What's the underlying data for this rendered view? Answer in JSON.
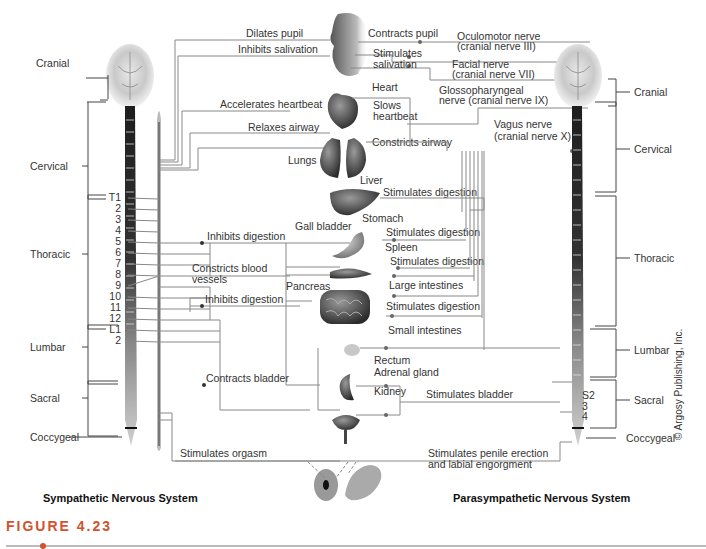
{
  "figure": {
    "label": "FIGURE 4.23",
    "accent_color": "#d0532e",
    "copyright": "© Argosy Publishing, Inc."
  },
  "titles": {
    "sympathetic": "Sympathetic Nervous System",
    "parasympathetic": "Parasympathetic Nervous System"
  },
  "left_regions": {
    "cranial": "Cranial",
    "cervical": "Cervical",
    "thoracic": "Thoracic",
    "lumbar": "Lumbar",
    "sacral": "Sacral",
    "coccygeal": "Coccygeal"
  },
  "right_regions": {
    "cranial": "Cranial",
    "cervical": "Cervical",
    "thoracic": "Thoracic",
    "lumbar": "Lumbar",
    "sacral": "Sacral",
    "coccygeal": "Coccygeal"
  },
  "vertebrae_left": [
    "T1",
    "2",
    "3",
    "4",
    "5",
    "6",
    "7",
    "8",
    "9",
    "10",
    "11",
    "12",
    "L1",
    "2"
  ],
  "vertebrae_right": [
    "S2",
    "3",
    "4"
  ],
  "sympathetic_effects": {
    "dilates_pupil": "Dilates pupil",
    "inhibits_salivation": "Inhibits salivation",
    "accelerates_heartbeat": "Accelerates heartbeat",
    "relaxes_airway": "Relaxes airway",
    "inhibits_digestion_1": "Inhibits digestion",
    "constricts_blood_1": "Constricts blood",
    "constricts_blood_2": "vessels",
    "inhibits_digestion_2": "Inhibits digestion",
    "contracts_bladder": "Contracts bladder",
    "stimulates_orgasm": "Stimulates orgasm"
  },
  "parasympathetic_effects": {
    "contracts_pupil": "Contracts pupil",
    "stimulates_salivation_1": "Stimulates",
    "stimulates_salivation_2": "salivation",
    "slows_heartbeat_1": "Slows",
    "slows_heartbeat_2": "heartbeat",
    "constricts_airway": "Constricts airway",
    "stim_digestion_liver": "Stimulates digestion",
    "stim_digestion_stomach": "Stimulates digestion",
    "stim_digestion_spleen": "Stimulates digestion",
    "stim_digestion_intestine": "Stimulates digestion",
    "stimulates_bladder": "Stimulates bladder",
    "stim_penile_1": "Stimulates penile erection",
    "stim_penile_2": "and labial engorgment"
  },
  "cranial_nerves": {
    "oculomotor_1": "Oculomotor nerve",
    "oculomotor_2": "(cranial nerve III)",
    "facial_1": "Facial nerve",
    "facial_2": "(cranial nerve VII)",
    "glosso_1": "Glossopharyngeal",
    "glosso_2": "nerve (cranial nerve IX)",
    "vagus_1": "Vagus nerve",
    "vagus_2": "(cranial nerve X)"
  },
  "organs": {
    "heart": "Heart",
    "lungs": "Lungs",
    "liver": "Liver",
    "gall_bladder": "Gall bladder",
    "stomach": "Stomach",
    "spleen": "Spleen",
    "pancreas": "Pancreas",
    "large_intestines": "Large intestines",
    "small_intestines": "Small intestines",
    "rectum": "Rectum",
    "adrenal_gland": "Adrenal gland",
    "kidney": "Kidney"
  }
}
